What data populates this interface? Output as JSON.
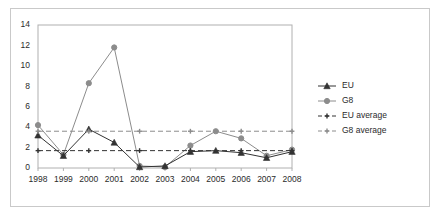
{
  "chart_data": {
    "type": "line",
    "title": "",
    "xlabel": "",
    "ylabel": "",
    "categories": [
      "1998",
      "1999",
      "2000",
      "2001",
      "2002",
      "2003",
      "2004",
      "2005",
      "2006",
      "2007",
      "2008"
    ],
    "xlim": [
      1998,
      2008
    ],
    "ylim": [
      0,
      14
    ],
    "yticks": [
      0,
      2,
      4,
      6,
      8,
      10,
      12,
      14
    ],
    "grid": false,
    "legend_position": "right",
    "series": [
      {
        "name": "EU",
        "marker": "triangle",
        "style": "solid",
        "color": "#333333",
        "values": [
          3.2,
          1.2,
          3.8,
          2.5,
          0.1,
          0.2,
          1.6,
          1.7,
          1.5,
          1.0,
          1.6
        ]
      },
      {
        "name": "G8",
        "marker": "circle",
        "style": "solid",
        "color": "#8c8c8c",
        "values": [
          4.2,
          1.3,
          8.3,
          11.8,
          0.2,
          0.1,
          2.2,
          3.6,
          2.9,
          1.2,
          1.8
        ]
      },
      {
        "name": "EU average",
        "marker": "cross",
        "style": "dashed",
        "color": "#333333",
        "value": 1.7
      },
      {
        "name": "G8 average",
        "marker": "cross",
        "style": "dashed",
        "color": "#8c8c8c",
        "value": 3.6
      }
    ]
  },
  "legend": {
    "items": [
      {
        "label": "EU"
      },
      {
        "label": "G8"
      },
      {
        "label": "EU average"
      },
      {
        "label": "G8 average"
      }
    ]
  },
  "axes": {
    "y_tick_labels": [
      "0",
      "2",
      "4",
      "6",
      "8",
      "10",
      "12",
      "14"
    ],
    "x_tick_labels": [
      "1998",
      "1999",
      "2000",
      "2001",
      "2002",
      "2003",
      "2004",
      "2005",
      "2006",
      "2007",
      "2008"
    ]
  },
  "colors": {
    "eu": "#333333",
    "g8": "#8c8c8c",
    "axis": "#b0b0b0",
    "border": "#c9c9c9",
    "text": "#2b2b2b",
    "background": "#ffffff"
  }
}
